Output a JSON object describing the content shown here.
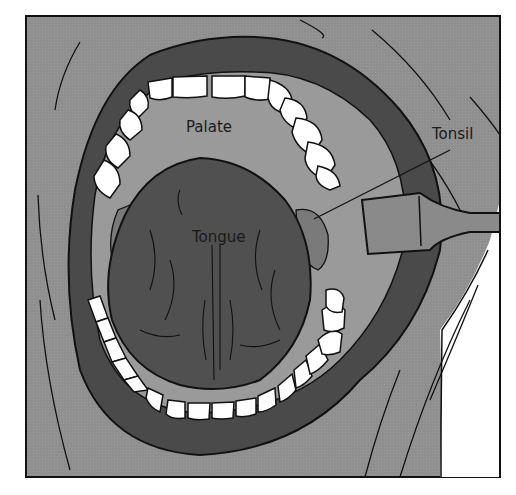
{
  "figure": {
    "colors": {
      "background": "#ffffff",
      "skin": "#8f8f8f",
      "lips": "#4a4a4a",
      "mouth_interior": "#9a9a9a",
      "tongue": "#505050",
      "teeth": "#ffffff",
      "outline": "#111111",
      "depressor": "#8a8a8a"
    },
    "labels": {
      "palate": "Palate",
      "tongue": "Tongue",
      "tonsil": "Tonsil"
    }
  }
}
